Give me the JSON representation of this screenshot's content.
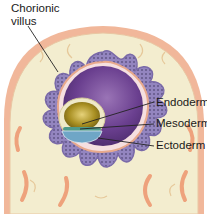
{
  "diagram": {
    "colors": {
      "uterine_tissue": "#f3edcf",
      "uterine_outer_band": "#f1b79a",
      "vessels": "#eea27c",
      "chorion_villi": "#8f7fb8",
      "villi_dots": "#4a3f6e",
      "amnion_sac": "#6a3f8f",
      "yolk_sac": "#a88f22",
      "mesoderm_band": "#4f9a8a",
      "ectoderm_disc": "#6fa6c6",
      "leader_lines": "#222222"
    },
    "labels": [
      {
        "id": "chorionic-villus",
        "line1": "Chorionic",
        "line2": "villus"
      },
      {
        "id": "endoderm",
        "text": "Endoderm"
      },
      {
        "id": "mesoderm",
        "text": "Mesoderm"
      },
      {
        "id": "ectoderm",
        "text": "Ectoderm"
      }
    ]
  }
}
